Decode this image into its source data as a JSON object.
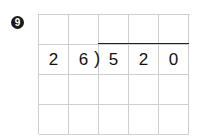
{
  "problem": {
    "number_badge": "9",
    "divisor": [
      "2",
      "6"
    ],
    "dividend": [
      "5",
      "2",
      "0"
    ],
    "grid": {
      "columns": 5,
      "rows": 4,
      "cells": [
        [
          "",
          "",
          "",
          "",
          ""
        ],
        [
          "2",
          "6",
          "5",
          "2",
          "0"
        ],
        [
          "",
          "",
          "",
          "",
          ""
        ],
        [
          "",
          "",
          "",
          "",
          ""
        ]
      ]
    },
    "division_bracket": ")"
  }
}
